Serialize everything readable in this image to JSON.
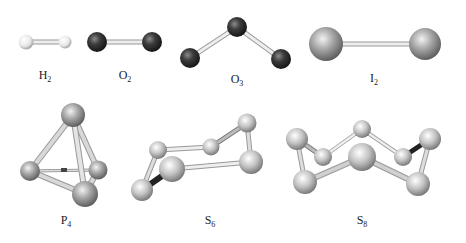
{
  "colors": {
    "hydrogen": "#f2f2f2",
    "oxygen": "#3a3a3a",
    "iodine": "#9a9a9a",
    "phosphorus": "#a8a8a8",
    "sulfur": "#c8c8c8",
    "bond": "#d8d8d8",
    "bond_dark": "#333333"
  },
  "molecules": [
    {
      "id": "H2",
      "symbol": "H",
      "subscript": "2",
      "atoms": 2
    },
    {
      "id": "O2",
      "symbol": "O",
      "subscript": "2",
      "atoms": 2
    },
    {
      "id": "O3",
      "symbol": "O",
      "subscript": "3",
      "atoms": 3
    },
    {
      "id": "I2",
      "symbol": "I",
      "subscript": "2",
      "atoms": 2
    },
    {
      "id": "P4",
      "symbol": "P",
      "subscript": "4",
      "atoms": 4
    },
    {
      "id": "S6",
      "symbol": "S",
      "subscript": "6",
      "atoms": 6
    },
    {
      "id": "S8",
      "symbol": "S",
      "subscript": "8",
      "atoms": 8
    }
  ]
}
